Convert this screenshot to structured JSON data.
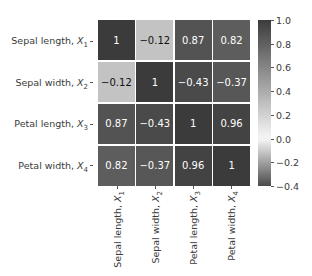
{
  "chart_data": {
    "type": "heatmap",
    "title": "",
    "subtitle": "",
    "xlabel": "",
    "ylabel": "",
    "grid": true,
    "legend_position": "right",
    "colormap": "grayscale-diverging",
    "categories": [
      "Sepal length, X1",
      "Sepal width, X2",
      "Petal length, X3",
      "Petal width, X4"
    ],
    "row_labels": [
      {
        "text": "Sepal length, ",
        "var": "X",
        "sub": "1"
      },
      {
        "text": "Sepal width, ",
        "var": "X",
        "sub": "2"
      },
      {
        "text": "Petal length, ",
        "var": "X",
        "sub": "3"
      },
      {
        "text": "Petal width, ",
        "var": "X",
        "sub": "4"
      }
    ],
    "col_labels": [
      {
        "text": "Sepal length, ",
        "var": "X",
        "sub": "1"
      },
      {
        "text": "Sepal width, ",
        "var": "X",
        "sub": "2"
      },
      {
        "text": "Petal length, ",
        "var": "X",
        "sub": "3"
      },
      {
        "text": "Petal width, ",
        "var": "X",
        "sub": "4"
      }
    ],
    "matrix": [
      [
        1,
        -0.12,
        0.87,
        0.82
      ],
      [
        -0.12,
        1,
        -0.43,
        -0.37
      ],
      [
        0.87,
        -0.43,
        1,
        0.96
      ],
      [
        0.82,
        -0.37,
        0.96,
        1
      ]
    ],
    "cell_text": [
      [
        "1",
        "−0.12",
        "0.87",
        "0.82"
      ],
      [
        "−0.12",
        "1",
        "−0.43",
        "−0.37"
      ],
      [
        "0.87",
        "−0.43",
        "1",
        "0.96"
      ],
      [
        "0.82",
        "−0.37",
        "0.96",
        "1"
      ]
    ],
    "zlim": [
      -0.4,
      1.0
    ],
    "colorbar": {
      "ticks": [
        1.0,
        0.8,
        0.6,
        0.4,
        0.2,
        0.0,
        -0.2,
        -0.4
      ],
      "tick_labels": [
        "1.0",
        "0.8",
        "0.6",
        "0.4",
        "0.2",
        "0.0",
        "−0.2",
        "−0.4"
      ],
      "vmin": -0.4,
      "vmax": 1.0
    }
  },
  "colors": {
    "background": "#ffffff",
    "text": "#3a3a3a",
    "cell_text": "#ffffff",
    "gridline": "#ffffff",
    "tick": "#555555",
    "cmap_high": "#3b3b3b",
    "cmap_mid": "#f7f7f7",
    "cmap_low": "#4a4a4a"
  }
}
